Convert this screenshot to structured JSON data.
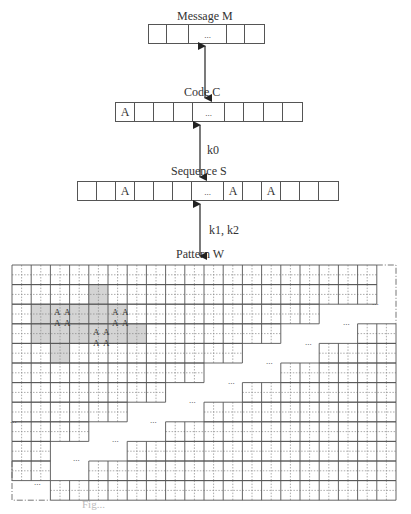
{
  "message": {
    "label": "Message M",
    "cells": [
      "",
      "",
      "...",
      "",
      ""
    ],
    "widths": [
      18,
      22,
      38,
      18,
      19
    ]
  },
  "code": {
    "label": "Code C",
    "cells": [
      "A",
      "",
      "",
      "",
      "...",
      "",
      "",
      "",
      ""
    ],
    "widths": [
      19,
      19,
      20,
      19,
      32,
      19,
      20,
      19,
      19
    ]
  },
  "sequence": {
    "label": "Sequence S",
    "cells": [
      "",
      "",
      "A",
      "",
      "",
      "",
      "...",
      "A",
      "",
      "A",
      "",
      "",
      ""
    ],
    "widths": [
      19,
      19,
      19,
      19,
      19,
      19,
      32,
      19,
      19,
      19,
      19,
      19,
      19
    ]
  },
  "arrows": {
    "m_to_c": {
      "label": ""
    },
    "c_to_s": {
      "label": "k0"
    },
    "s_to_w": {
      "label": "k1, k2"
    }
  },
  "pattern": {
    "label": "Pattern W",
    "x0": 12,
    "y0": 265,
    "cw": 19.2,
    "rh": 19.6,
    "cols": 20,
    "rows": 12,
    "row_spans": [
      {
        "left_end": 19.0,
        "right_start": null
      },
      {
        "left_end": 19.0,
        "right_start": null
      },
      {
        "left_end": 16.0,
        "right_start": null
      },
      {
        "left_end": 14.0,
        "right_start": 18.0
      },
      {
        "left_end": 12.0,
        "right_start": 16.0
      },
      {
        "left_end": 10.0,
        "right_start": 14.0
      },
      {
        "left_end": 8.0,
        "right_start": 12.0
      },
      {
        "left_end": 6.0,
        "right_start": 10.0
      },
      {
        "left_end": 4.0,
        "right_start": 8.0
      },
      {
        "left_end": 2.0,
        "right_start": 6.0
      },
      {
        "left_end": 2.0,
        "right_start": 4.0
      },
      {
        "left_end": 0.0,
        "right_start": 2.0
      }
    ],
    "ellipses": [
      {
        "x": 372,
        "y": 305,
        "text": "..."
      },
      {
        "x": 343,
        "y": 325,
        "text": "..."
      },
      {
        "x": 305,
        "y": 345,
        "text": "..."
      },
      {
        "x": 266,
        "y": 364,
        "text": "..."
      },
      {
        "x": 228,
        "y": 384,
        "text": "..."
      },
      {
        "x": 189,
        "y": 403,
        "text": "..."
      },
      {
        "x": 150,
        "y": 423,
        "text": "..."
      },
      {
        "x": 112,
        "y": 442,
        "text": "..."
      },
      {
        "x": 73,
        "y": 461,
        "text": "..."
      },
      {
        "x": 34,
        "y": 485,
        "text": "..."
      },
      {
        "x": 10,
        "y": 423,
        "text": "..."
      }
    ],
    "shaded_region": [
      [
        31,
        304
      ],
      [
        88,
        304
      ],
      [
        88,
        285
      ],
      [
        108,
        285
      ],
      [
        108,
        304
      ],
      [
        127,
        304
      ],
      [
        127,
        324
      ],
      [
        147,
        324
      ],
      [
        147,
        343
      ],
      [
        69,
        343
      ],
      [
        69,
        363
      ],
      [
        50,
        363
      ],
      [
        50,
        343
      ],
      [
        31,
        343
      ]
    ],
    "shade_color": "#d4d4d4",
    "a_markers": [
      {
        "x": 54,
        "y": 307,
        "text": "A"
      },
      {
        "x": 64,
        "y": 307,
        "text": "A"
      },
      {
        "x": 54,
        "y": 318,
        "text": "A"
      },
      {
        "x": 64,
        "y": 318,
        "text": "A"
      },
      {
        "x": 112,
        "y": 307,
        "text": "A"
      },
      {
        "x": 122,
        "y": 307,
        "text": "A"
      },
      {
        "x": 112,
        "y": 318,
        "text": "A"
      },
      {
        "x": 122,
        "y": 318,
        "text": "A"
      },
      {
        "x": 93,
        "y": 327,
        "text": "A"
      },
      {
        "x": 103,
        "y": 327,
        "text": "A"
      },
      {
        "x": 93,
        "y": 338,
        "text": "A"
      },
      {
        "x": 103,
        "y": 338,
        "text": "A"
      }
    ]
  },
  "caption": {
    "text": "Fig..."
  }
}
